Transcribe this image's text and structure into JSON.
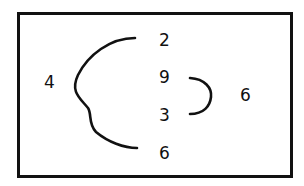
{
  "diagram": {
    "left_label": "4",
    "column": [
      "2",
      "9",
      "3",
      "6"
    ],
    "right_label": "6",
    "colors": {
      "ink": "#111111",
      "background": "#ffffff"
    }
  }
}
